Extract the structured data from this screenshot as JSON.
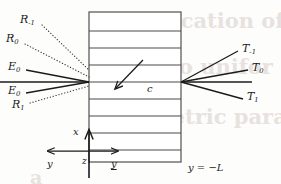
{
  "figure": {
    "name": "multilayer-diffraction-diagram",
    "background_color": "#fdfdfc",
    "ink_color": "#1b1b1b",
    "ghost_text_color": "#e8e2de"
  },
  "ghost_text": [
    {
      "text": "plication of RCW",
      "x": 150,
      "y": 8,
      "size": 21
    },
    {
      "text": "s to unifor",
      "x": 150,
      "y": 54,
      "size": 21
    },
    {
      "text": "eometric para",
      "x": 122,
      "y": 104,
      "size": 21
    },
    {
      "text": "a",
      "x": 30,
      "y": 166,
      "size": 19
    }
  ],
  "stack": {
    "label": "layered-medium",
    "left_x": 89,
    "right_x": 181,
    "top_y": 12,
    "bottom_y": 162,
    "layer_line_y": [
      12,
      31,
      48,
      65,
      82,
      99,
      116,
      133,
      150,
      162
    ],
    "layer_count": 9
  },
  "incident": {
    "vertex_x": 89,
    "vertex_y": 82,
    "rays": [
      {
        "name": "incident-ray-upper",
        "label": "E",
        "sub": "0",
        "x1": 26,
        "y1": 70,
        "x2": 89,
        "y2": 82,
        "label_x": 8,
        "label_y": 61
      },
      {
        "name": "incident-ray-middle",
        "label": "",
        "sub": "",
        "x1": 0,
        "y1": 82,
        "x2": 89,
        "y2": 82,
        "label_x": 0,
        "label_y": 0
      },
      {
        "name": "incident-ray-lower",
        "label": "E",
        "sub": "0",
        "x1": 26,
        "y1": 93,
        "x2": 89,
        "y2": 82,
        "label_x": 8,
        "label_y": 85
      }
    ]
  },
  "reflected": {
    "vertex_x": 89,
    "vertex_y": 82,
    "orders": [
      {
        "name": "reflected-order-minus-1",
        "label": "R",
        "sub": "-1",
        "x1": 42,
        "y1": 25,
        "x2": 89,
        "y2": 70,
        "label_x": 20,
        "label_y": 14
      },
      {
        "name": "reflected-order-0",
        "label": "R",
        "sub": "0",
        "x1": 25,
        "y1": 44,
        "x2": 89,
        "y2": 77,
        "label_x": 6,
        "label_y": 33
      },
      {
        "name": "reflected-order-1",
        "label": "R",
        "sub": "1",
        "x1": 30,
        "y1": 103,
        "x2": 89,
        "y2": 86,
        "label_x": 12,
        "label_y": 99
      }
    ]
  },
  "transmitted": {
    "vertex_x": 181,
    "vertex_y": 82,
    "orders": [
      {
        "name": "transmitted-order-minus-1",
        "label": "T",
        "sub": "-1",
        "x1": 181,
        "y1": 82,
        "x2": 238,
        "y2": 51,
        "label_x": 242,
        "label_y": 43
      },
      {
        "name": "transmitted-order-0",
        "label": "T",
        "sub": "0",
        "x1": 181,
        "y1": 82,
        "x2": 248,
        "y2": 70,
        "label_x": 252,
        "label_y": 62
      },
      {
        "name": "transmitted-order-flat",
        "label": "",
        "sub": "",
        "x1": 181,
        "y1": 82,
        "x2": 252,
        "y2": 82,
        "label_x": 0,
        "label_y": 0
      },
      {
        "name": "transmitted-order-1",
        "label": "T",
        "sub": "1",
        "x1": 181,
        "y1": 82,
        "x2": 243,
        "y2": 99,
        "label_x": 247,
        "label_y": 91
      }
    ]
  },
  "velocity_arrow": {
    "name": "velocity-vector-c",
    "label": "c",
    "x1": 143,
    "y1": 60,
    "x2": 113,
    "y2": 91,
    "label_x": 147,
    "label_y": 84
  },
  "axes": {
    "origin_x": 89,
    "origin_y": 151,
    "vertical": {
      "name": "x-axis",
      "label": "x",
      "tip_y": 128,
      "label_x": 73,
      "label_y": 127
    },
    "horizontal": {
      "name": "y-axis-bidirectional",
      "left_tip_x": 46,
      "right_tip_x": 120,
      "y": 151,
      "left_label": "y",
      "left_label_x": 47,
      "left_label_y": 159,
      "right_label": "y",
      "right_label_x": 111,
      "right_label_y": 159,
      "right_label_underlined": true
    },
    "origin_label": {
      "name": "z-axis-origin-label",
      "text": "z",
      "x": 82,
      "y": 157
    }
  },
  "annotations": [
    {
      "name": "boundary-label-y-equals-minus-L",
      "text_var": "y",
      "text_op": " = −",
      "text_val": "L",
      "x": 188,
      "y": 163
    }
  ]
}
